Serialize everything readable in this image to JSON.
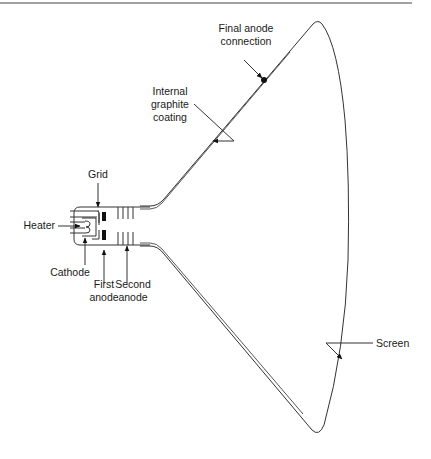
{
  "diagram": {
    "labels": {
      "final_anode_line1": "Final anode",
      "final_anode_line2": "connection",
      "graphite_line1": "Internal",
      "graphite_line2": "graphite",
      "graphite_line3": "coating",
      "grid": "Grid",
      "heater": "Heater",
      "cathode": "Cathode",
      "first_anode_line1": "First",
      "first_anode_line2": "anode",
      "second_anode_line1": "Second",
      "second_anode_line2": "anode",
      "screen": "Screen"
    },
    "colors": {
      "line": "#333333",
      "text": "#1a1a1a",
      "background": "#ffffff"
    }
  }
}
